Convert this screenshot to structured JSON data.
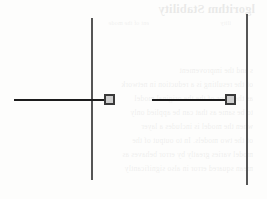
{
  "figure": {
    "kind": "axis-diagram",
    "background_color": "#fdfdfc",
    "axis_color": "#555555",
    "line_color": "#1c1c1c",
    "node_fill_color": "#cfcfcf",
    "node_stroke_color": "#3a3a3a",
    "elements": {
      "left_vertical_axis": "vertical-axis-left",
      "right_vertical_axis": "vertical-axis-right",
      "left_horizontal_segment": "horizontal-segment-left",
      "right_horizontal_segment": "horizontal-segment-right",
      "left_node": "node-marker-left",
      "right_node": "node-marker-right"
    }
  },
  "bleedthrough": {
    "note": "faint mirrored text showing through from the reverse side of the page; illegible",
    "title": "lgorithm Stability",
    "subtitle_left": "ility",
    "subtitle_right": "ent of the mode",
    "body": [
      "s and the improvement",
      "of the resulting is a reduction in network",
      "as the error of the  the original model",
      "to be same as that  can be applied only",
      "when the model is  includes a layer",
      "of the two models. In to output of the",
      "model varies greatly by error behaves as",
      "mean squared error in  also significantly"
    ]
  }
}
